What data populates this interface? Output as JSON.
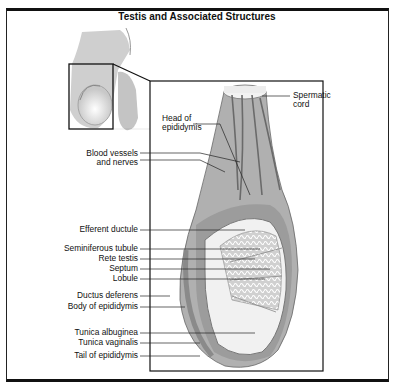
{
  "title": "Testis and Associated Structures",
  "labels": {
    "spermatic_cord": [
      "Spermatic",
      "cord"
    ],
    "head_of_epididymis": [
      "Head of",
      "epididymis"
    ],
    "blood_vessels": [
      "Blood vessels",
      "and nerves"
    ],
    "efferent_ductule": "Efferent ductule",
    "seminiferous_tubule": "Seminiferous tubule",
    "rete_testis": "Rete testis",
    "septum": "Septum",
    "lobule": "Lobule",
    "ductus_deferens": "Ductus deferens",
    "body_of_epididymis": "Body of epididymis",
    "tunica_albuginea": "Tunica albuginea",
    "tunica_vaginalis": "Tunica vaginalis",
    "tail_of_epididymis": "Tail of epididymis"
  },
  "colors": {
    "line": "#222222",
    "tissue": "#a8a8a8",
    "light": "#e4e4e4",
    "dark": "#6a6a6a"
  }
}
